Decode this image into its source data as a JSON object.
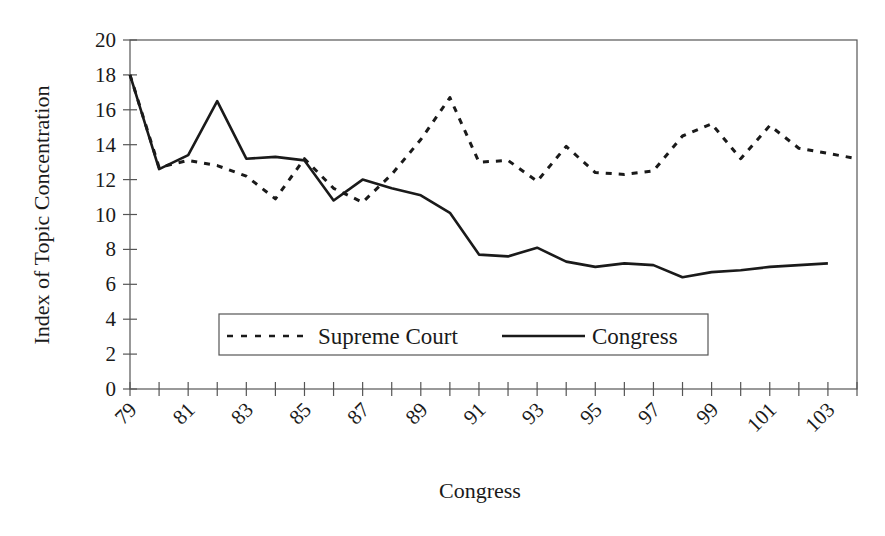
{
  "chart_data": {
    "type": "line",
    "title": "",
    "xlabel": "Congress",
    "ylabel": "Index of Topic Concentration",
    "xlim": [
      79,
      104
    ],
    "ylim": [
      0,
      20
    ],
    "y_ticks": [
      0,
      2,
      4,
      6,
      8,
      10,
      12,
      14,
      16,
      18,
      20
    ],
    "x_tick_labels": [
      "79",
      "81",
      "83",
      "85",
      "87",
      "89",
      "91",
      "93",
      "95",
      "97",
      "99",
      "101",
      "103"
    ],
    "grid": false,
    "legend_position": "inside-bottom-center",
    "series": [
      {
        "name": "Supreme Court",
        "style": "dashed",
        "x": [
          79,
          80,
          81,
          82,
          83,
          84,
          85,
          86,
          87,
          88,
          89,
          90,
          91,
          92,
          93,
          94,
          95,
          96,
          97,
          98,
          99,
          100,
          101,
          102,
          103,
          104
        ],
        "values": [
          18.0,
          12.7,
          13.1,
          12.8,
          12.2,
          10.9,
          13.2,
          11.5,
          10.7,
          12.3,
          14.3,
          16.7,
          13.0,
          13.1,
          11.9,
          13.9,
          12.4,
          12.3,
          12.5,
          14.5,
          15.2,
          13.2,
          15.1,
          13.8,
          13.5,
          13.2
        ]
      },
      {
        "name": "Congress",
        "style": "solid",
        "x": [
          79,
          80,
          81,
          82,
          83,
          84,
          85,
          86,
          87,
          88,
          89,
          90,
          91,
          92,
          93,
          94,
          95,
          96,
          97,
          98,
          99,
          100,
          101,
          102,
          103
        ],
        "values": [
          18.0,
          12.6,
          13.4,
          16.5,
          13.2,
          13.3,
          13.1,
          10.8,
          12.0,
          11.5,
          11.1,
          10.1,
          7.7,
          7.6,
          8.1,
          7.3,
          7.0,
          7.2,
          7.1,
          6.4,
          6.7,
          6.8,
          7.0,
          7.1,
          7.2
        ]
      }
    ]
  },
  "legend": {
    "items": [
      {
        "label": "Supreme Court",
        "style": "dashed"
      },
      {
        "label": "Congress",
        "style": "solid"
      }
    ]
  },
  "colors": {
    "line": "#1a1a1a",
    "axis": "#555555",
    "background": "#ffffff"
  }
}
